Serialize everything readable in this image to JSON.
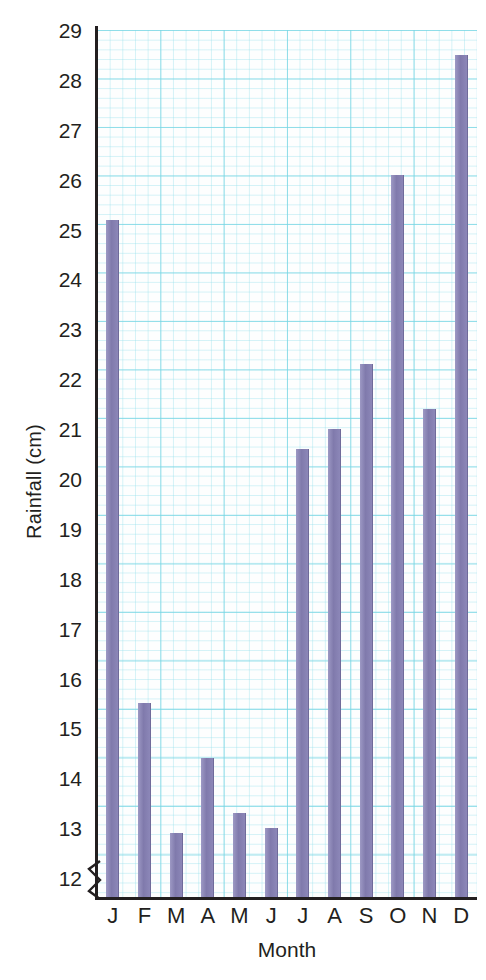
{
  "chart_data": {
    "type": "bar",
    "title": "",
    "xlabel": "Month",
    "ylabel": "Rainfall (cm)",
    "categories": [
      "J",
      "F",
      "M",
      "A",
      "M",
      "J",
      "J",
      "A",
      "S",
      "O",
      "N",
      "D"
    ],
    "category_names": [
      "January",
      "February",
      "March",
      "April",
      "May",
      "June",
      "July",
      "August",
      "September",
      "October",
      "November",
      "December"
    ],
    "values": [
      25.2,
      15.5,
      12.9,
      14.4,
      13.3,
      13.0,
      20.6,
      21.0,
      22.3,
      26.1,
      21.4,
      28.5
    ],
    "ylim": [
      11.6,
      29
    ],
    "yticks": [
      12,
      13,
      14,
      15,
      16,
      17,
      18,
      19,
      20,
      21,
      22,
      23,
      24,
      25,
      26,
      27,
      28,
      29
    ],
    "ytick_labels": [
      "12",
      "13",
      "14",
      "15",
      "16",
      "17",
      "18",
      "19",
      "20",
      "21",
      "22",
      "23",
      "24",
      "25",
      "26",
      "27",
      "28",
      "29"
    ],
    "grid": true,
    "grid_style": "graph-paper",
    "legend": false,
    "axis_break": true,
    "axis_break_below": 12,
    "bar_color": "#8b86b8",
    "grid_color": "#78d6e4",
    "axis_color": "#231f20"
  }
}
